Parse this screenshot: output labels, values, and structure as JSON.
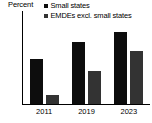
{
  "chart_data": {
    "type": "bar",
    "title": "",
    "subtitle": "",
    "xlabel": "",
    "ylabel": "Percent",
    "categories": [
      "2011",
      "2019",
      "2023"
    ],
    "series": [
      {
        "name": "Small states",
        "values": [
          34,
          47,
          54
        ],
        "color": "#0d0d0d"
      },
      {
        "name": "EMDEs excl. small states",
        "values": [
          7,
          25,
          40
        ],
        "color": "#333333"
      }
    ],
    "ylim": [
      0,
      70
    ],
    "yticks": [
      70,
      60,
      50,
      40,
      30,
      20,
      10,
      0
    ],
    "ytick_labels": [
      "70",
      "60",
      "50",
      "40",
      "30",
      "20",
      "10",
      "0"
    ],
    "grid": false,
    "legend_position": "top-right",
    "annotations": []
  },
  "axis": {
    "unit_label": "Percent"
  },
  "legend": {
    "items": [
      {
        "label": "Small states",
        "swatch_color": "#0d0d0d",
        "marker": "square-marker"
      },
      {
        "label": "EMDEs excl. small states",
        "swatch_color": "#333333",
        "marker": "square-marker"
      }
    ]
  },
  "colors": {
    "axis": "#000000",
    "text": "#000000",
    "background": "#ffffff",
    "series_1": "#0d0d0d",
    "series_2": "#333333"
  }
}
